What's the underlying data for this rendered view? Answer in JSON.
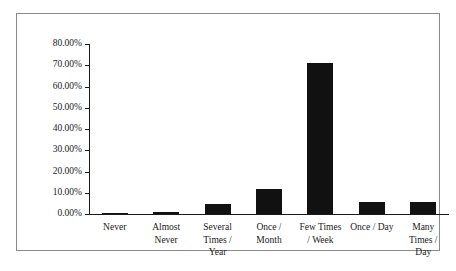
{
  "chart_data": {
    "type": "bar",
    "title": "",
    "xlabel": "",
    "ylabel": "",
    "ylim": [
      0,
      80
    ],
    "grid": false,
    "legend": "none",
    "categories": [
      "Never",
      "Almost Never",
      "Several Times / Year",
      "Once / Month",
      "Few Times / Week",
      "Once / Day",
      "Many Times / Day"
    ],
    "category_lines": [
      [
        "Never"
      ],
      [
        "Almost",
        "Never"
      ],
      [
        "Several",
        "Times /",
        "Year"
      ],
      [
        "Once /",
        "Month"
      ],
      [
        "Few Times",
        "/ Week"
      ],
      [
        "Once / Day"
      ],
      [
        "Many",
        "Times /",
        "Day"
      ]
    ],
    "values": [
      0.5,
      1.0,
      4.5,
      12.0,
      71.0,
      5.5,
      5.5
    ],
    "value_labels": [
      "0.50%",
      "1.00%",
      "4.50%",
      "12.00%",
      "71.00%",
      "5.50%",
      "5.50%"
    ],
    "ytick_values": [
      0,
      10,
      20,
      30,
      40,
      50,
      60,
      70,
      80
    ],
    "ytick_labels": [
      "0.00%",
      "10.00%",
      "20.00%",
      "30.00%",
      "40.00%",
      "50.00%",
      "60.00%",
      "70.00%",
      "80.00%"
    ],
    "bar_color": "#111111",
    "axis_color": "#1a1a1a",
    "frame_color": "#8c8c8c",
    "background_color": "#ffffff"
  }
}
